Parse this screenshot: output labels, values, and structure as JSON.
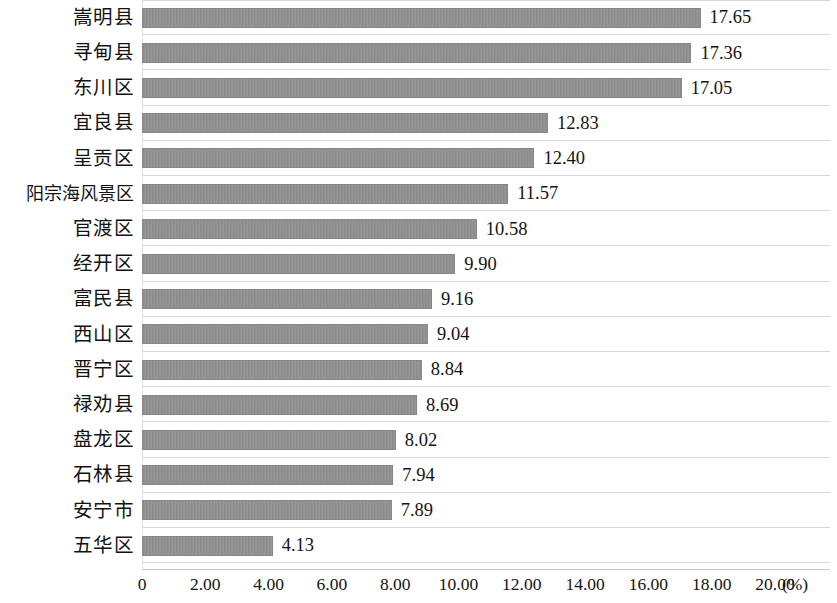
{
  "chart_data": {
    "type": "bar",
    "orientation": "horizontal",
    "title": "",
    "subtitle": "",
    "xlabel": "(%)",
    "ylabel": "",
    "xlim": [
      0,
      20
    ],
    "xticks": [
      "0",
      "2.00",
      "4.00",
      "6.00",
      "8.00",
      "10.00",
      "12.00",
      "14.00",
      "16.00",
      "18.00",
      "20.00"
    ],
    "xtick_values": [
      0,
      2,
      4,
      6,
      8,
      10,
      12,
      14,
      16,
      18,
      20
    ],
    "grid": "horizontal-only",
    "legend": "none",
    "bar_color": "#8d8d8d",
    "categories": [
      "嵩明县",
      "寻甸县",
      "东川区",
      "宜良县",
      "呈贡区",
      "阳宗海风景区",
      "官渡区",
      "经开区",
      "富民县",
      "西山区",
      "晋宁区",
      "禄劝县",
      "盘龙区",
      "石林县",
      "安宁市",
      "五华区"
    ],
    "values": [
      17.65,
      17.36,
      17.05,
      12.83,
      12.4,
      11.57,
      10.58,
      9.9,
      9.16,
      9.04,
      8.84,
      8.69,
      8.02,
      7.94,
      7.89,
      4.13
    ],
    "value_labels": [
      "17.65",
      "17.36",
      "17.05",
      "12.83",
      "12.40",
      "11.57",
      "10.58",
      "9.90",
      "9.16",
      "9.04",
      "8.84",
      "8.69",
      "8.02",
      "7.94",
      "7.89",
      "4.13"
    ]
  }
}
